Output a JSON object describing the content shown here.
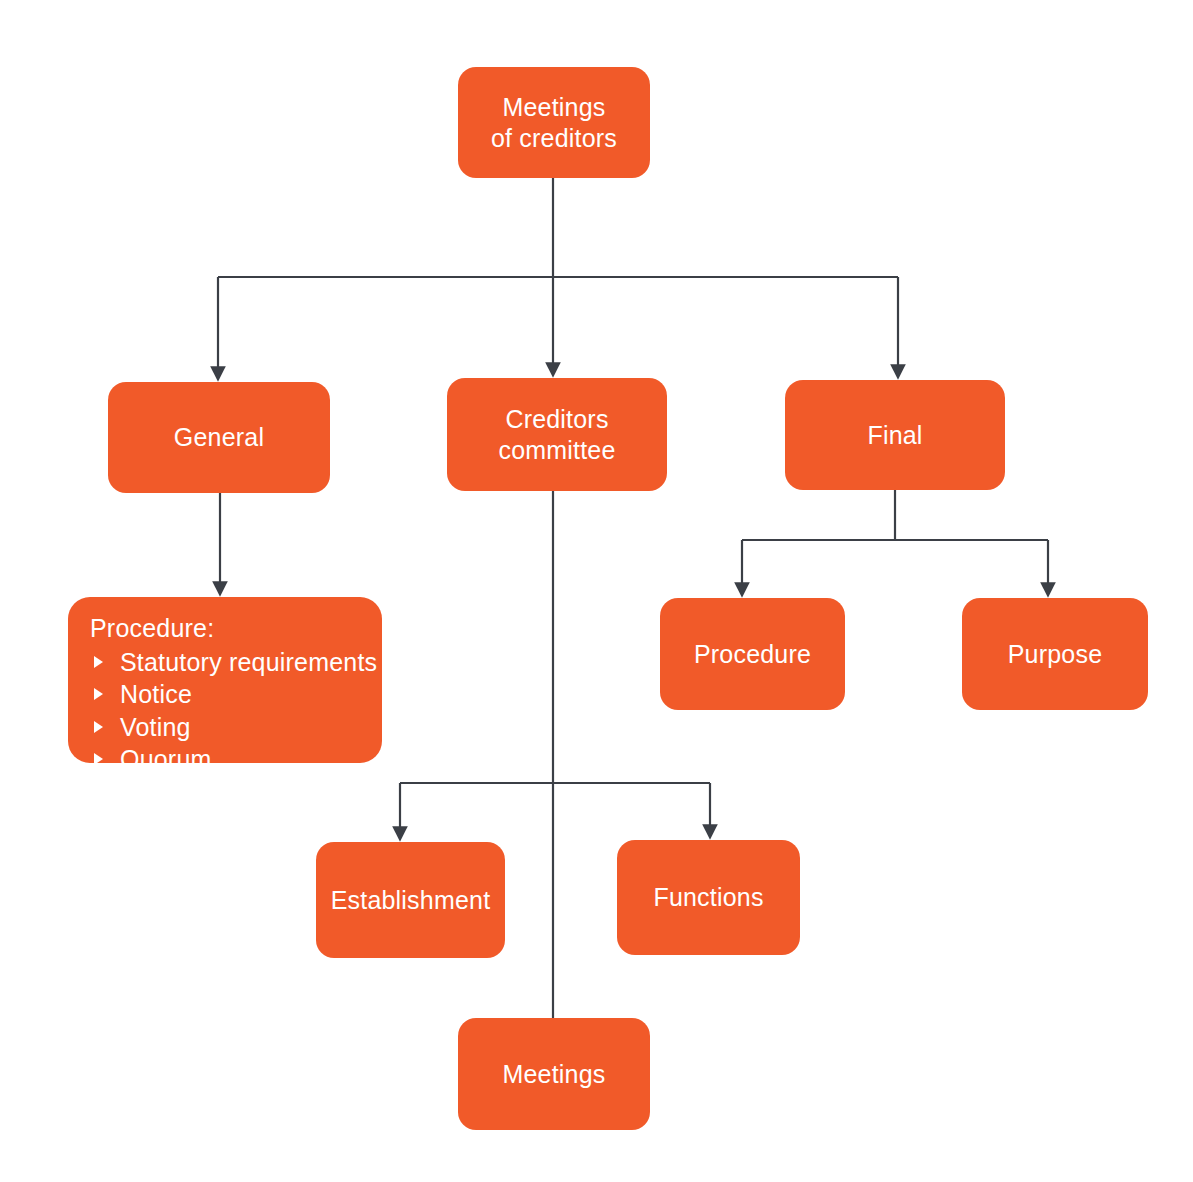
{
  "diagram": {
    "title": "Meetings of creditors",
    "background_color": "#ffffff",
    "node_color": "#f15a29",
    "node_text_color": "#ffffff",
    "edge_color": "#3b3f46",
    "nodes": {
      "root": {
        "label": "Meetings\nof creditors"
      },
      "general": {
        "label": "General"
      },
      "creditors_committee": {
        "label": "Creditors\ncommittee"
      },
      "final": {
        "label": "Final"
      },
      "general_procedure": {
        "title": "Procedure:",
        "bullets": [
          "Statutory requirements",
          "Notice",
          "Voting",
          "Quorum"
        ]
      },
      "final_procedure": {
        "label": "Procedure"
      },
      "final_purpose": {
        "label": "Purpose"
      },
      "committee_establishment": {
        "label": "Establishment"
      },
      "committee_functions": {
        "label": "Functions"
      },
      "committee_meetings": {
        "label": "Meetings"
      }
    },
    "edges": [
      {
        "from": "root",
        "to": "general"
      },
      {
        "from": "root",
        "to": "creditors_committee"
      },
      {
        "from": "root",
        "to": "final"
      },
      {
        "from": "general",
        "to": "general_procedure"
      },
      {
        "from": "final",
        "to": "final_procedure"
      },
      {
        "from": "final",
        "to": "final_purpose"
      },
      {
        "from": "creditors_committee",
        "to": "committee_establishment"
      },
      {
        "from": "creditors_committee",
        "to": "committee_functions"
      },
      {
        "from": "creditors_committee",
        "to": "committee_meetings"
      }
    ]
  }
}
